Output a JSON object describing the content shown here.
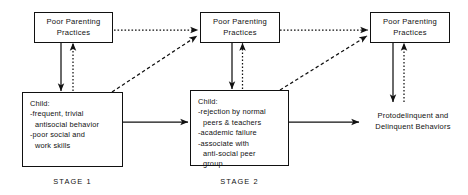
{
  "diagram": {
    "colors": {
      "ink": "#111111",
      "background": "#ffffff"
    },
    "nodes": {
      "parenting_1": {
        "line1": "Poor Parenting",
        "line2": "Practices"
      },
      "parenting_2": {
        "line1": "Poor Parenting",
        "line2": "Practices"
      },
      "parenting_3": {
        "line1": "Poor Parenting",
        "line2": "Practices"
      },
      "child_stage_1": {
        "heading": "Child:",
        "items": [
          "-frequent, trivial",
          "antisocial behavior",
          "-poor social and",
          "work skills"
        ]
      },
      "child_stage_2": {
        "heading": "Child:",
        "items": [
          "-rejection by normal",
          "peers & teachers",
          "-academic failure",
          "-associate with",
          "anti-social peer",
          "group"
        ]
      },
      "outcome": {
        "line1": "Protodelinquent and",
        "line2": "Delinquent Behaviors"
      }
    },
    "stage_labels": {
      "stage_1": "STAGE 1",
      "stage_2": "STAGE 2"
    }
  }
}
